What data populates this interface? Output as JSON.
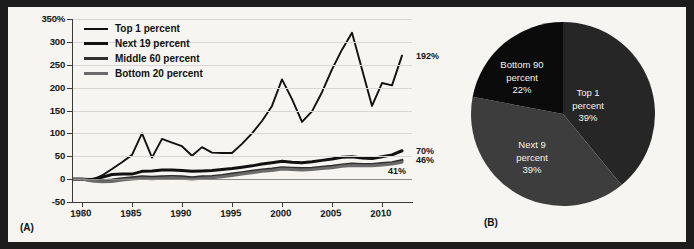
{
  "figure": {
    "panel_a_tag": "(A)",
    "panel_b_tag": "(B)"
  },
  "chart_data": [
    {
      "type": "line",
      "panel": "A",
      "title": "",
      "xlabel": "",
      "ylabel": "",
      "ylim": [
        -50,
        350
      ],
      "xlim": [
        1979,
        2013
      ],
      "grid": true,
      "legend_position": "top-left",
      "y_ticks": [
        "350%",
        "300",
        "250",
        "200",
        "150",
        "100",
        "50",
        "0",
        "-50"
      ],
      "y_tick_values": [
        350,
        300,
        250,
        200,
        150,
        100,
        50,
        0,
        -50
      ],
      "x_ticks": [
        "1980",
        "1985",
        "1990",
        "1995",
        "2000",
        "2005",
        "2010"
      ],
      "x_tick_values": [
        1980,
        1985,
        1990,
        1995,
        2000,
        2005,
        2010
      ],
      "x": [
        1979,
        1980,
        1981,
        1982,
        1983,
        1984,
        1985,
        1986,
        1987,
        1988,
        1989,
        1990,
        1991,
        1992,
        1993,
        1994,
        1995,
        1996,
        1997,
        1998,
        1999,
        2000,
        2001,
        2002,
        2003,
        2004,
        2005,
        2006,
        2007,
        2008,
        2009,
        2010,
        2011,
        2012
      ],
      "series": [
        {
          "name": "Top 1 percent",
          "color": "#111111",
          "width": 1.9,
          "end_label": "192%",
          "values": [
            0,
            0,
            -2,
            8,
            22,
            37,
            53,
            100,
            47,
            88,
            80,
            72,
            51,
            70,
            58,
            57,
            57,
            77,
            100,
            127,
            160,
            218,
            175,
            125,
            148,
            190,
            240,
            283,
            320,
            240,
            160,
            210,
            205,
            270,
            192
          ]
        },
        {
          "name": "Next 19 percent",
          "color": "#111111",
          "width": 3.0,
          "end_label": "70%",
          "values": [
            0,
            0,
            -1,
            4,
            10,
            11,
            11,
            17,
            18,
            20,
            20,
            19,
            17,
            18,
            19,
            21,
            23,
            26,
            29,
            33,
            36,
            39,
            37,
            36,
            38,
            41,
            44,
            48,
            49,
            46,
            45,
            49,
            53,
            62,
            70
          ]
        },
        {
          "name": "Middle 60 percent",
          "color": "#2f2f2f",
          "width": 3.0,
          "end_label": "46%",
          "values": [
            0,
            0,
            -3,
            -4,
            -2,
            1,
            3,
            5,
            4,
            5,
            6,
            5,
            3,
            5,
            6,
            8,
            11,
            14,
            17,
            20,
            22,
            25,
            24,
            23,
            24,
            26,
            28,
            31,
            33,
            32,
            32,
            34,
            36,
            41,
            46
          ]
        },
        {
          "name": "Bottom 20 percent",
          "color": "#6b6b6b",
          "width": 3.0,
          "end_label": "41%",
          "values": [
            0,
            0,
            -4,
            -6,
            -5,
            -2,
            0,
            2,
            1,
            2,
            3,
            2,
            0,
            2,
            3,
            5,
            8,
            11,
            14,
            17,
            19,
            22,
            21,
            20,
            21,
            23,
            25,
            28,
            30,
            29,
            29,
            31,
            33,
            37,
            41
          ]
        }
      ]
    },
    {
      "type": "pie",
      "panel": "B",
      "title": "",
      "start_angle_deg": 0,
      "direction": "clockwise",
      "slices": [
        {
          "label_line1": "Top 1",
          "label_line2": "percent",
          "value": 39,
          "value_text": "39%",
          "color": "#262626"
        },
        {
          "label_line1": "Next 9",
          "label_line2": "percent",
          "value": 39,
          "value_text": "39%",
          "color": "#3d3d3d"
        },
        {
          "label_line1": "Bottom 90",
          "label_line2": "percent",
          "value": 22,
          "value_text": "22%",
          "color": "#0b0b0b"
        }
      ]
    }
  ],
  "colors": {
    "figure_border": "#1c1c1c",
    "panel_background": "#f6f5f1",
    "gridline": "#d9d8d4",
    "axis": "#3a3a38",
    "text": "#141414"
  }
}
